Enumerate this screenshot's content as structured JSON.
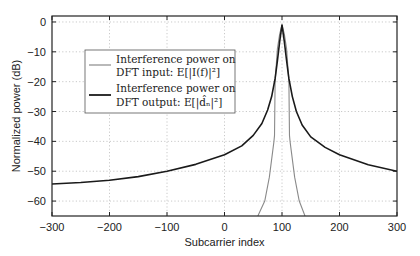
{
  "chart_data": {
    "type": "line",
    "title": "",
    "xlabel": "Subcarrier index",
    "ylabel": "Normalized power (dB)",
    "xlim": [
      -300,
      300
    ],
    "ylim": [
      -65,
      2
    ],
    "xticks": [
      -300,
      -200,
      -100,
      0,
      100,
      200,
      300
    ],
    "yticks": [
      0,
      -10,
      -20,
      -30,
      -40,
      -50,
      -60
    ],
    "xtick_labels": [
      "−300",
      "−200",
      "−100",
      "0",
      "100",
      "200",
      "300"
    ],
    "ytick_labels": [
      "0",
      "−10",
      "−20",
      "−30",
      "−40",
      "−50",
      "−60"
    ],
    "grid": true,
    "legend_position": "upper-left-center",
    "series": [
      {
        "name": "Interference power on DFT input: E[|I(f)|²]",
        "legend_line1": "Interference power on",
        "legend_line2": "DFT input: E[|I(f)|²]",
        "color": "#8a8a8a",
        "x": [
          58,
          70,
          78,
          84,
          86,
          87,
          88,
          92,
          96,
          100,
          104,
          108,
          112,
          113,
          114,
          116,
          122,
          130,
          140
        ],
        "y": [
          -65,
          -60,
          -52,
          -43,
          -40,
          -38,
          -20,
          -9,
          -4,
          -1,
          -4,
          -9,
          -20,
          -38,
          -40,
          -43,
          -52,
          -60,
          -65
        ]
      },
      {
        "name": "Interference power on DFT output: E[|d̂ₙ|²]",
        "legend_line1": "Interference power on",
        "legend_line2": "DFT output: E[|d̂ₙ|²]",
        "color": "#1a1a1a",
        "x": [
          -300,
          -250,
          -200,
          -150,
          -100,
          -50,
          0,
          30,
          50,
          65,
          75,
          82,
          88,
          92,
          96,
          100,
          104,
          108,
          112,
          118,
          125,
          135,
          150,
          175,
          200,
          250,
          300
        ],
        "y": [
          -54.3,
          -53.8,
          -53,
          -51.8,
          -50,
          -47.7,
          -44.5,
          -41.5,
          -38,
          -34,
          -29.5,
          -25,
          -19,
          -13,
          -6.5,
          -1,
          -6.5,
          -13,
          -19,
          -25,
          -30,
          -34.5,
          -38.5,
          -42,
          -44.5,
          -47.8,
          -50
        ]
      }
    ]
  }
}
